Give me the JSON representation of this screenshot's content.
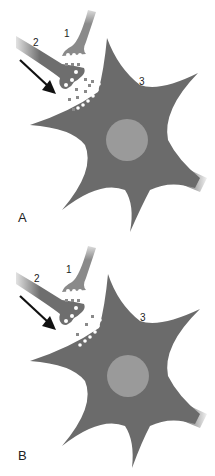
{
  "figure": {
    "panels": [
      {
        "id": "A",
        "label": "A",
        "callouts": {
          "presynaptic_1": "1",
          "presynaptic_2": "2",
          "postsynaptic_cell": "3"
        },
        "arrow": "signal-direction-arrow",
        "vesicle_release": "many"
      },
      {
        "id": "B",
        "label": "B",
        "callouts": {
          "presynaptic_1": "1",
          "presynaptic_2": "2",
          "postsynaptic_cell": "3"
        },
        "arrow": "signal-direction-arrow",
        "vesicle_release": "few"
      }
    ],
    "colors": {
      "cell_body": "#6b6b6b",
      "nucleus": "#9a9a9a",
      "terminal_1": "#8a8a8a",
      "terminal_2": "#6e6e6e",
      "arrow": "#111111",
      "background": "#ffffff"
    }
  }
}
